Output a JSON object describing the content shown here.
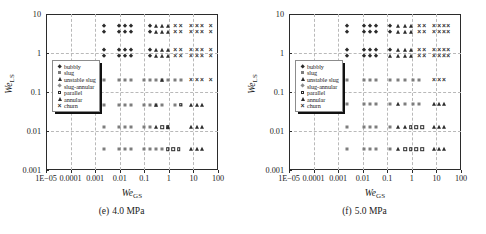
{
  "figure": {
    "panels": [
      {
        "caption_id": "(e)",
        "caption_text": "4.0 MPa",
        "xtitle_main": "We",
        "xtitle_sub": "GS",
        "ytitle_main": "We",
        "ytitle_sub": "LS"
      },
      {
        "caption_id": "(f)",
        "caption_text": "5.0 MPa",
        "xtitle_main": "We",
        "xtitle_sub": "GS",
        "ytitle_main": "We",
        "ytitle_sub": "LS"
      }
    ],
    "legend": {
      "items": [
        {
          "label": "bubbly",
          "marker": "filled-diamond-icon"
        },
        {
          "label": "slug",
          "marker": "gray-square-icon"
        },
        {
          "label": "unstable slug",
          "marker": "filled-triangle-icon"
        },
        {
          "label": "slug-annular",
          "marker": "gray-diamond-icon"
        },
        {
          "label": "parallel",
          "marker": "open-square-icon"
        },
        {
          "label": "annular",
          "marker": "filled-triangle-icon"
        },
        {
          "label": "churn",
          "marker": "cross-x-icon"
        }
      ]
    }
  },
  "chart_data": [
    {
      "type": "scatter",
      "title": "(e) 4.0 MPa",
      "xlabel": "We_GS",
      "ylabel": "We_LS",
      "xscale": "log",
      "yscale": "log",
      "xlim": [
        1e-05,
        100
      ],
      "ylim": [
        0.001,
        10
      ],
      "xticks": [
        "1E-05",
        "0.0001",
        "0.001",
        "0.01",
        "0.1",
        "1",
        "10",
        "100"
      ],
      "yticks": [
        "10",
        "1",
        "0.1",
        "0.01",
        "0.001"
      ],
      "grid": true,
      "legend_position": "left-middle",
      "series": [
        {
          "name": "bubbly",
          "points": [
            [
              0.0022,
              5.0
            ],
            [
              0.0022,
              3.5
            ],
            [
              0.0022,
              1.2
            ],
            [
              0.0022,
              0.82
            ],
            [
              0.009,
              5.0
            ],
            [
              0.017,
              5.0
            ],
            [
              0.03,
              5.0
            ],
            [
              0.009,
              3.5
            ],
            [
              0.017,
              3.5
            ],
            [
              0.03,
              3.5
            ],
            [
              0.009,
              1.2
            ],
            [
              0.017,
              1.2
            ],
            [
              0.03,
              1.2
            ],
            [
              0.009,
              0.82
            ],
            [
              0.017,
              0.82
            ],
            [
              0.03,
              0.82
            ],
            [
              0.17,
              5.0
            ],
            [
              0.17,
              3.5
            ],
            [
              0.17,
              1.2
            ],
            [
              0.17,
              0.82
            ]
          ]
        },
        {
          "name": "slug",
          "points": [
            [
              0.0022,
              0.2
            ],
            [
              0.009,
              0.2
            ],
            [
              0.017,
              0.2
            ],
            [
              0.03,
              0.2
            ],
            [
              0.1,
              0.2
            ],
            [
              0.17,
              0.2
            ],
            [
              0.3,
              0.2
            ],
            [
              0.55,
              0.2
            ],
            [
              0.9,
              0.2
            ],
            [
              1.8,
              0.2
            ],
            [
              3.0,
              0.2
            ],
            [
              0.0022,
              0.047
            ],
            [
              0.009,
              0.047
            ],
            [
              0.017,
              0.047
            ],
            [
              0.03,
              0.047
            ],
            [
              0.1,
              0.047
            ],
            [
              0.17,
              0.047
            ],
            [
              0.3,
              0.047
            ],
            [
              0.55,
              0.047
            ],
            [
              1.8,
              0.047
            ],
            [
              3.0,
              0.047
            ],
            [
              0.0022,
              0.0125
            ],
            [
              0.009,
              0.0125
            ],
            [
              0.017,
              0.0125
            ],
            [
              0.03,
              0.0125
            ],
            [
              0.1,
              0.0125
            ],
            [
              0.17,
              0.0125
            ],
            [
              0.0022,
              0.0034
            ],
            [
              0.009,
              0.0034
            ],
            [
              0.017,
              0.0034
            ],
            [
              0.03,
              0.0034
            ],
            [
              0.1,
              0.0034
            ],
            [
              0.17,
              0.0034
            ],
            [
              0.3,
              0.0034
            ],
            [
              0.55,
              0.0034
            ],
            [
              0.9,
              0.0034
            ],
            [
              1.5,
              0.0034
            ]
          ]
        },
        {
          "name": "unstable slug",
          "points": [
            [
              0.3,
              5.0
            ],
            [
              0.3,
              3.5
            ],
            [
              0.3,
              1.2
            ],
            [
              0.3,
              0.82
            ],
            [
              0.55,
              5.0
            ],
            [
              0.9,
              5.0
            ],
            [
              0.55,
              3.5
            ],
            [
              0.9,
              3.5
            ],
            [
              0.55,
              1.2
            ],
            [
              0.9,
              1.2
            ],
            [
              0.55,
              0.82
            ],
            [
              0.9,
              0.82
            ]
          ]
        },
        {
          "name": "parallel",
          "points": [
            [
              3.0,
              0.047
            ],
            [
              0.55,
              0.0125
            ],
            [
              0.9,
              0.0125
            ],
            [
              1.5,
              0.0034
            ],
            [
              2.5,
              0.0034
            ],
            [
              0.9,
              0.0034
            ]
          ]
        },
        {
          "name": "annular",
          "points": [
            [
              0.55,
              0.2
            ],
            [
              0.9,
              0.0125
            ],
            [
              8.0,
              0.047
            ],
            [
              14.0,
              0.047
            ],
            [
              22.0,
              0.047
            ],
            [
              8.0,
              0.0125
            ],
            [
              14.0,
              0.0125
            ],
            [
              22.0,
              0.0125
            ],
            [
              8.0,
              0.0034
            ],
            [
              14.0,
              0.0034
            ],
            [
              22.0,
              0.0034
            ],
            [
              0.3,
              0.0125
            ],
            [
              0.3,
              0.047
            ]
          ]
        },
        {
          "name": "churn",
          "points": [
            [
              1.8,
              5.0
            ],
            [
              3.0,
              5.0
            ],
            [
              8.0,
              5.0
            ],
            [
              14.0,
              5.0
            ],
            [
              22.0,
              5.0
            ],
            [
              50.0,
              5.0
            ],
            [
              1.8,
              3.5
            ],
            [
              3.0,
              3.5
            ],
            [
              8.0,
              3.5
            ],
            [
              14.0,
              3.5
            ],
            [
              22.0,
              3.5
            ],
            [
              50.0,
              3.5
            ],
            [
              1.8,
              1.2
            ],
            [
              3.0,
              1.2
            ],
            [
              8.0,
              1.2
            ],
            [
              14.0,
              1.2
            ],
            [
              22.0,
              1.2
            ],
            [
              50.0,
              1.2
            ],
            [
              1.8,
              0.82
            ],
            [
              3.0,
              0.82
            ],
            [
              8.0,
              0.82
            ],
            [
              14.0,
              0.82
            ],
            [
              22.0,
              0.82
            ],
            [
              50.0,
              0.82
            ],
            [
              8.0,
              0.2
            ],
            [
              14.0,
              0.2
            ],
            [
              22.0,
              0.2
            ],
            [
              50.0,
              0.2
            ]
          ]
        }
      ]
    },
    {
      "type": "scatter",
      "title": "(f) 5.0 MPa",
      "xlabel": "We_GS",
      "ylabel": "We_LS",
      "xscale": "log",
      "yscale": "log",
      "xlim": [
        1e-05,
        100
      ],
      "ylim": [
        0.001,
        10
      ],
      "xticks": [
        "1E-05",
        "0.0001",
        "0.001",
        "0.01",
        "0.1",
        "1",
        "10",
        "100"
      ],
      "yticks": [
        "10",
        "1",
        "0.1",
        "0.01",
        "0.001"
      ],
      "grid": true,
      "legend_position": "left-middle",
      "series": [
        {
          "name": "bubbly",
          "points": [
            [
              0.0022,
              5.0
            ],
            [
              0.0022,
              3.5
            ],
            [
              0.0022,
              1.2
            ],
            [
              0.0022,
              0.82
            ],
            [
              0.011,
              5.0
            ],
            [
              0.02,
              5.0
            ],
            [
              0.035,
              5.0
            ],
            [
              0.011,
              3.5
            ],
            [
              0.02,
              3.5
            ],
            [
              0.035,
              3.5
            ],
            [
              0.011,
              1.2
            ],
            [
              0.02,
              1.2
            ],
            [
              0.035,
              1.2
            ],
            [
              0.011,
              0.82
            ],
            [
              0.02,
              0.82
            ],
            [
              0.035,
              0.82
            ],
            [
              0.13,
              5.0
            ],
            [
              0.13,
              3.5
            ],
            [
              0.13,
              1.2
            ]
          ]
        },
        {
          "name": "slug",
          "points": [
            [
              0.0022,
              0.2
            ],
            [
              0.011,
              0.2
            ],
            [
              0.02,
              0.2
            ],
            [
              0.035,
              0.2
            ],
            [
              0.13,
              0.2
            ],
            [
              0.28,
              0.2
            ],
            [
              0.55,
              0.2
            ],
            [
              1.1,
              0.2
            ],
            [
              2.0,
              0.2
            ],
            [
              0.0022,
              0.05
            ],
            [
              0.011,
              0.05
            ],
            [
              0.02,
              0.05
            ],
            [
              0.035,
              0.05
            ],
            [
              0.13,
              0.05
            ],
            [
              0.55,
              0.05
            ],
            [
              1.1,
              0.05
            ],
            [
              2.0,
              0.05
            ],
            [
              0.0022,
              0.0125
            ],
            [
              0.011,
              0.0125
            ],
            [
              0.02,
              0.0125
            ],
            [
              0.035,
              0.0125
            ],
            [
              0.13,
              0.0125
            ],
            [
              0.0022,
              0.0034
            ],
            [
              0.011,
              0.0034
            ],
            [
              0.02,
              0.0034
            ],
            [
              0.035,
              0.0034
            ],
            [
              0.13,
              0.0034
            ]
          ]
        },
        {
          "name": "unstable slug",
          "points": [
            [
              0.28,
              5.0
            ],
            [
              0.28,
              3.5
            ],
            [
              0.28,
              1.2
            ],
            [
              0.28,
              0.82
            ],
            [
              0.55,
              5.0
            ],
            [
              0.9,
              5.0
            ],
            [
              0.55,
              3.5
            ],
            [
              0.9,
              3.5
            ],
            [
              0.55,
              1.2
            ],
            [
              0.9,
              1.2
            ],
            [
              0.55,
              0.82
            ],
            [
              0.9,
              0.82
            ],
            [
              0.13,
              0.82
            ]
          ]
        },
        {
          "name": "parallel",
          "points": [
            [
              0.9,
              0.0125
            ],
            [
              1.5,
              0.0125
            ],
            [
              2.6,
              0.0125
            ],
            [
              0.55,
              0.0034
            ],
            [
              0.9,
              0.0034
            ],
            [
              1.5,
              0.0034
            ],
            [
              2.6,
              0.0034
            ]
          ]
        },
        {
          "name": "annular",
          "points": [
            [
              0.28,
              0.05
            ],
            [
              0.55,
              0.0125
            ],
            [
              0.28,
              0.0125
            ],
            [
              0.28,
              0.0034
            ],
            [
              8.0,
              0.05
            ],
            [
              13.0,
              0.05
            ],
            [
              20.0,
              0.05
            ],
            [
              8.0,
              0.0125
            ],
            [
              13.0,
              0.0125
            ],
            [
              20.0,
              0.0125
            ],
            [
              8.0,
              0.0034
            ],
            [
              13.0,
              0.0034
            ],
            [
              20.0,
              0.0034
            ]
          ]
        },
        {
          "name": "churn",
          "points": [
            [
              2.0,
              5.0
            ],
            [
              3.2,
              5.0
            ],
            [
              8.0,
              5.0
            ],
            [
              13.0,
              5.0
            ],
            [
              20.0,
              5.0
            ],
            [
              30.0,
              5.0
            ],
            [
              2.0,
              3.5
            ],
            [
              3.2,
              3.5
            ],
            [
              8.0,
              3.5
            ],
            [
              13.0,
              3.5
            ],
            [
              20.0,
              3.5
            ],
            [
              30.0,
              3.5
            ],
            [
              2.0,
              1.2
            ],
            [
              3.2,
              1.2
            ],
            [
              8.0,
              1.2
            ],
            [
              13.0,
              1.2
            ],
            [
              20.0,
              1.2
            ],
            [
              30.0,
              1.2
            ],
            [
              2.0,
              0.82
            ],
            [
              3.2,
              0.82
            ],
            [
              8.0,
              0.82
            ],
            [
              13.0,
              0.82
            ],
            [
              20.0,
              0.82
            ],
            [
              30.0,
              0.82
            ],
            [
              8.0,
              0.2
            ],
            [
              13.0,
              0.2
            ],
            [
              20.0,
              0.2
            ]
          ]
        }
      ]
    }
  ]
}
